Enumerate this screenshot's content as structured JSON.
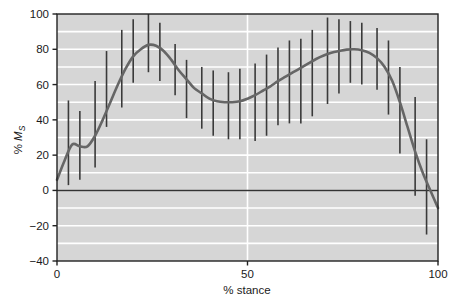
{
  "chart_data": {
    "type": "line",
    "title": "",
    "subtitle": "",
    "xlabel": "% stance",
    "ylabel": "% Ms",
    "ylabel_parts": {
      "prefix": "% ",
      "italic": "M",
      "subscript": "S"
    },
    "xlim": [
      0,
      100
    ],
    "ylim": [
      -40,
      100
    ],
    "xticks": [
      0,
      50,
      100
    ],
    "xticklabels": [
      "0",
      "50",
      "100"
    ],
    "yticks": [
      -40,
      -20,
      0,
      20,
      40,
      60,
      80,
      100
    ],
    "yticklabels": [
      "-40",
      "-20",
      "0",
      "20",
      "40",
      "60",
      "80",
      "100"
    ],
    "grid": {
      "horizontal": true,
      "horizontal_minor_step": 10,
      "vertical": true,
      "vertical_values": [
        50
      ],
      "color": "#ffffff"
    },
    "plot_background": "#d6d6d6",
    "legend": null,
    "zero_line": {
      "value": 0,
      "color": "#333333"
    },
    "series": [
      {
        "name": "mean curve",
        "type": "line",
        "color": "#666666",
        "width": 2.6,
        "x": [
          0,
          2,
          4,
          6,
          8,
          10,
          12,
          14,
          16,
          18,
          20,
          22,
          24,
          26,
          28,
          30,
          32,
          34,
          36,
          38,
          40,
          42,
          44,
          46,
          48,
          50,
          52,
          54,
          56,
          58,
          60,
          62,
          64,
          66,
          68,
          70,
          72,
          74,
          76,
          78,
          80,
          82,
          84,
          86,
          88,
          90,
          92,
          94,
          96,
          98,
          100
        ],
        "y": [
          6,
          17,
          26,
          25,
          25,
          31,
          40,
          50,
          60,
          69,
          76,
          80,
          82.5,
          82,
          79,
          74,
          68,
          63,
          58,
          55,
          52,
          50.5,
          50,
          50,
          50.5,
          52,
          54,
          56.5,
          59,
          62,
          64.5,
          67,
          69.5,
          72,
          74.5,
          76.5,
          78,
          79,
          79.8,
          80,
          79.5,
          78,
          75,
          70,
          62,
          50,
          36,
          22,
          10,
          0,
          -10
        ]
      },
      {
        "name": "error bars (range)",
        "type": "errorbar",
        "color": "#3a3a3a",
        "width": 1.6,
        "points": [
          {
            "x": 3,
            "low": 3,
            "high": 51
          },
          {
            "x": 6,
            "low": 6,
            "high": 45
          },
          {
            "x": 10,
            "low": 13,
            "high": 62
          },
          {
            "x": 13,
            "low": 36,
            "high": 79
          },
          {
            "x": 17,
            "low": 47,
            "high": 91
          },
          {
            "x": 20,
            "low": 61,
            "high": 97
          },
          {
            "x": 24,
            "low": 67,
            "high": 100
          },
          {
            "x": 27,
            "low": 62,
            "high": 95
          },
          {
            "x": 31,
            "low": 54,
            "high": 83
          },
          {
            "x": 34,
            "low": 41,
            "high": 74
          },
          {
            "x": 38,
            "low": 35,
            "high": 70
          },
          {
            "x": 41,
            "low": 31,
            "high": 68
          },
          {
            "x": 45,
            "low": 29,
            "high": 67
          },
          {
            "x": 48,
            "low": 29,
            "high": 69
          },
          {
            "x": 52,
            "low": 28,
            "high": 72
          },
          {
            "x": 55,
            "low": 31,
            "high": 77
          },
          {
            "x": 58,
            "low": 37,
            "high": 81
          },
          {
            "x": 61,
            "low": 38,
            "high": 85
          },
          {
            "x": 64,
            "low": 38,
            "high": 86
          },
          {
            "x": 67,
            "low": 42,
            "high": 91
          },
          {
            "x": 71,
            "low": 49,
            "high": 98
          },
          {
            "x": 74,
            "low": 55,
            "high": 97
          },
          {
            "x": 77,
            "low": 61,
            "high": 96
          },
          {
            "x": 80,
            "low": 60,
            "high": 95
          },
          {
            "x": 84,
            "low": 57,
            "high": 92
          },
          {
            "x": 87,
            "low": 43,
            "high": 85
          },
          {
            "x": 90,
            "low": 21,
            "high": 70
          },
          {
            "x": 94,
            "low": -3,
            "high": 53
          },
          {
            "x": 97,
            "low": -25,
            "high": 29
          }
        ]
      }
    ]
  },
  "axes": {
    "frame_color": "#222222",
    "tick_color": "#222222"
  }
}
